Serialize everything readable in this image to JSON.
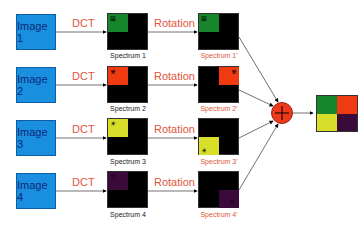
{
  "diagram": {
    "operations": {
      "dct": "DCT",
      "rotation": "Rotation",
      "combine": "+"
    },
    "colors": {
      "image_box": "#1a8fe0",
      "image_text": "#0a2a7a",
      "operation_label": "#e2553a",
      "spectrum_bg": "#000000",
      "plus_circle": "#ee3a1c"
    },
    "rows": [
      {
        "image": "Image 1",
        "spectrum": "Spectrum 1",
        "rotated": "Spectrum 1'",
        "color": "#17852b",
        "glyph": "⊠",
        "rot_position": "top-left"
      },
      {
        "image": "Image 2",
        "spectrum": "Spectrum 2",
        "rotated": "Spectrum 2'",
        "color": "#f03a12",
        "glyph": "⋇",
        "rot_position": "top-right"
      },
      {
        "image": "Image 3",
        "spectrum": "Spectrum 3",
        "rotated": "Spectrum 3'",
        "color": "#d8de2a",
        "glyph": "☀",
        "rot_position": "bottom-left"
      },
      {
        "image": "Image 4",
        "spectrum": "Spectrum 4",
        "rotated": "Spectrum 4'",
        "color": "#3a0b3a",
        "glyph": "✲",
        "rot_position": "bottom-right"
      }
    ],
    "output": {
      "quadrants": [
        "#17852b",
        "#f03a12",
        "#d8de2a",
        "#3a0b3a"
      ]
    }
  }
}
